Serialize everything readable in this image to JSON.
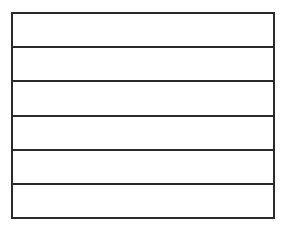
{
  "diagram": {
    "type": "empty-ruled-box",
    "row_count": 6,
    "line_color": "#2a2a2a",
    "background": "#ffffff",
    "rows": [
      {
        "text": ""
      },
      {
        "text": ""
      },
      {
        "text": ""
      },
      {
        "text": ""
      },
      {
        "text": ""
      },
      {
        "text": ""
      }
    ]
  }
}
